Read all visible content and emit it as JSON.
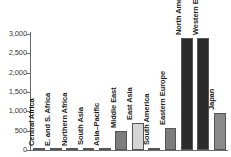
{
  "chart_data": {
    "type": "bar",
    "title": "",
    "subtitle": "",
    "xlabel": "",
    "ylabel": "",
    "ylim": [
      0,
      3000
    ],
    "yticks": [
      "0",
      "500",
      "1,000",
      "1,500",
      "2,000",
      "2,500",
      "3,000"
    ],
    "ytick_values": [
      0,
      500,
      1000,
      1500,
      2000,
      2500,
      3000
    ],
    "grid": false,
    "legend": "none",
    "categories": [
      "Central Africa",
      "E. and S. Africa",
      "Northern Africa",
      "South Asia",
      "Asia–Pacific",
      "Middle East",
      "East Asia",
      "South America",
      "Eastern Europe",
      "North America",
      "Western Europe",
      "Japan"
    ],
    "values": [
      10,
      30,
      15,
      60,
      12,
      500,
      700,
      60,
      580,
      2900,
      2900,
      960
    ],
    "bar_colors": [
      "#6f6f6f",
      "#6f6f6f",
      "#6f6f6f",
      "#8f8f8f",
      "#6f6f6f",
      "#7d7d7d",
      "#d5d5d5",
      "#9a9a9a",
      "#7d7d7d",
      "#2b2b2b",
      "#2b2b2b",
      "#8a8a8a"
    ]
  },
  "axis": {
    "axis_color": "#6a6a6a",
    "label_color": "#3a3a3a"
  }
}
